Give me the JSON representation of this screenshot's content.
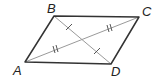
{
  "diagram": {
    "type": "parallelogram",
    "name": "ABCD",
    "vertices": [
      {
        "label": "A",
        "x": 25,
        "y": 62,
        "label_x": 13,
        "label_y": 75
      },
      {
        "label": "B",
        "x": 54,
        "y": 16,
        "label_x": 47,
        "label_y": 13
      },
      {
        "label": "C",
        "x": 139,
        "y": 17,
        "label_x": 142,
        "label_y": 16
      },
      {
        "label": "D",
        "x": 111,
        "y": 64,
        "label_x": 111,
        "label_y": 76
      }
    ],
    "sides": [
      "AB",
      "BC",
      "CD",
      "DA"
    ],
    "diagonals": [
      {
        "name": "AC",
        "tick_marks": 2
      },
      {
        "name": "BD",
        "tick_marks": 1
      }
    ],
    "colors": {
      "side": "#333333",
      "diagonal": "#9a9a9a",
      "label": "#222222"
    }
  }
}
